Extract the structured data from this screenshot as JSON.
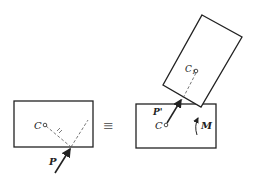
{
  "diagram": {
    "left_panel": {
      "center_label": "C",
      "force_label": "P"
    },
    "equivalence_symbol": "≡",
    "right_panel": {
      "center_label": "C",
      "translated_force_label": "P'",
      "moment_label": "M",
      "offset_center_label": "C",
      "offset_center_subscript": "1"
    },
    "colors": {
      "stroke": "#222222",
      "dashed": "#555555",
      "background": "#ffffff"
    }
  }
}
